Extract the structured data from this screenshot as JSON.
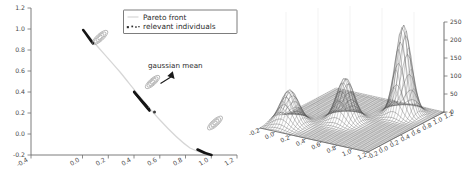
{
  "figure": {
    "background": "#ffffff",
    "panel_count": 2
  },
  "chart_data": [
    {
      "type": "line",
      "panel": "left",
      "title": "",
      "xlabel": "",
      "ylabel": "",
      "xlim": [
        -0.4,
        1.2
      ],
      "ylim": [
        -0.2,
        1.2
      ],
      "grid": false,
      "xticks": [
        "-0.4",
        "0.0",
        "0.2",
        "0.4",
        "0.6",
        "0.8",
        "1.0",
        "1.2"
      ],
      "xtick_values": [
        -0.4,
        0.0,
        0.2,
        0.4,
        0.6,
        0.8,
        1.0,
        1.2
      ],
      "yticks": [
        "-0.2",
        "0.0",
        "0.2",
        "0.4",
        "0.6",
        "0.8",
        "1.0",
        "1.2"
      ],
      "ytick_values": [
        -0.2,
        0.0,
        0.2,
        0.4,
        0.6,
        0.8,
        1.0,
        1.2
      ],
      "legend": {
        "position": "upper right",
        "entries": [
          {
            "label": "Pareto front",
            "marker": "line",
            "color": "#d6d6d6"
          },
          {
            "label": "relevant individuals",
            "marker": "dots",
            "color": "#2a2a2a"
          }
        ]
      },
      "annotations": [
        {
          "text": "gaussian mean",
          "x": 0.63,
          "y": 0.6,
          "arrow_to_x": 0.545,
          "arrow_to_y": 0.435
        }
      ],
      "series": [
        {
          "name": "Pareto front",
          "color": "#d6d6d6",
          "x": [
            0.0,
            0.05,
            0.1,
            0.15,
            0.2,
            0.25,
            0.3,
            0.35,
            0.4,
            0.45,
            0.5,
            0.55,
            0.6,
            0.65,
            0.7,
            0.75,
            0.8,
            0.85,
            0.9,
            0.95,
            1.0
          ],
          "y": [
            1.0,
            0.95,
            0.9,
            0.85,
            0.799,
            0.748,
            0.695,
            0.64,
            0.583,
            0.524,
            0.462,
            0.395,
            0.324,
            0.247,
            0.163,
            0.07,
            0.0,
            0.0,
            0.0,
            0.0,
            0.0
          ]
        },
        {
          "name": "relevant individuals",
          "color": "#151515",
          "segments": [
            {
              "x0": 0.005,
              "y0": 0.995,
              "x1": 0.065,
              "y1": 0.935
            },
            {
              "x0": 0.4,
              "y0": 0.583,
              "x1": 0.515,
              "y1": 0.475
            },
            {
              "x0": 0.89,
              "y0": 0.08,
              "x1": 0.985,
              "y1": 0.01
            }
          ]
        }
      ],
      "gaussian_clusters": [
        {
          "cx": 0.135,
          "cy": 0.93,
          "angle": -42,
          "rings": 4,
          "mean_x": 0.135,
          "mean_y": 0.93
        },
        {
          "cx": 0.545,
          "cy": 0.43,
          "angle": -42,
          "rings": 4,
          "mean_x": 0.545,
          "mean_y": 0.43
        },
        {
          "cx": 1.035,
          "cy": 0.125,
          "angle": -42,
          "rings": 4,
          "mean_x": 1.035,
          "mean_y": 0.125
        }
      ],
      "mean_markers": [
        {
          "x": 0.565,
          "y": 0.265
        }
      ]
    },
    {
      "type": "surface",
      "panel": "right",
      "title": "",
      "projection": "3d",
      "xlabel": "",
      "ylabel": "",
      "zlabel": "",
      "grid": true,
      "xlim": [
        -0.2,
        1.2
      ],
      "ylim": [
        -0.2,
        1.2
      ],
      "zlim": [
        0,
        250
      ],
      "xticks": [
        "-0.2",
        "0.0",
        "0.2",
        "0.4",
        "0.6",
        "0.8",
        "1.0",
        "1.2"
      ],
      "xtick_values": [
        -0.2,
        0.0,
        0.2,
        0.4,
        0.6,
        0.8,
        1.0,
        1.2
      ],
      "yticks": [
        "-0.2",
        "0.0",
        "0.2",
        "0.4",
        "0.6",
        "0.8",
        "1.0",
        "1.2"
      ],
      "ytick_values": [
        -0.2,
        0.0,
        0.2,
        0.4,
        0.6,
        0.8,
        1.0,
        1.2
      ],
      "zticks": [
        "0",
        "50",
        "100",
        "150",
        "200",
        "250"
      ],
      "ztick_values": [
        0,
        50,
        100,
        150,
        200,
        250
      ],
      "surface_style": "wireframe-mesh",
      "surface_color": "#2e2e2e",
      "peaks": [
        {
          "cx": 0.13,
          "cy": 0.92,
          "amp": 250,
          "sx": 0.085,
          "sy": 0.085
        },
        {
          "cx": 0.545,
          "cy": 0.44,
          "amp": 120,
          "sx": 0.095,
          "sy": 0.095
        },
        {
          "cx": 1.0,
          "cy": 0.06,
          "amp": 95,
          "sx": 0.1,
          "sy": 0.1
        }
      ]
    }
  ]
}
